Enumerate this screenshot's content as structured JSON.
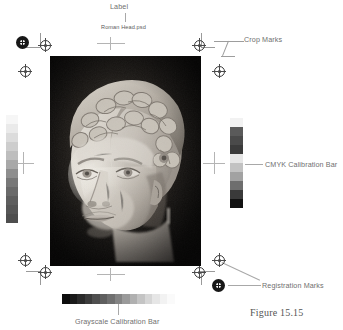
{
  "figure": {
    "caption": "Figure 15.15",
    "document_name": "Roman Head.psd"
  },
  "annotations": [
    {
      "id": "label",
      "text": "Label",
      "leader": "vertical-down"
    },
    {
      "id": "crop-marks",
      "text": "Crop Marks",
      "leader": "angled-left"
    },
    {
      "id": "cmyk-bar",
      "text": "CMYK Calibration Bar",
      "leader": "horizontal-left"
    },
    {
      "id": "registration",
      "text": "Registration Marks",
      "leader": "two-diagonals-left"
    },
    {
      "id": "grayscale-bar",
      "text": "Grayscale Calibration Bar",
      "leader": "vertical-up"
    }
  ],
  "page_label": {
    "text": "Roman Head.psd"
  },
  "colors": {
    "page_background": "#ffffff",
    "annotation_text": "#6f6f6f",
    "leader_line": "#a8a8a8",
    "registration_mark": "#1c1c1c",
    "crop_mark": "#9a9a9a",
    "caption_text": "#555555",
    "photo_background": "#14110f"
  },
  "calibration": {
    "grayscale_vertical": {
      "orientation": "vertical",
      "from": "white",
      "to": "dark-gray",
      "swatches": [
        "#f6f6f6",
        "#eaeaea",
        "#dcdcdc",
        "#cdcdcd",
        "#bdbdbd",
        "#a8a8a8",
        "#8e8e8e",
        "#787878",
        "#6a6a6a",
        "#5e5e5e",
        "#565656",
        "#4e4e4e"
      ]
    },
    "cmyk_vertical": {
      "orientation": "vertical",
      "swatches": [
        "#f2f2f2",
        "#5a5a5a",
        "#4a4a4a",
        "#3b3b3b",
        "#e6e6e6",
        "#c2c2c2",
        "#a2a2a2",
        "#6e6e6e",
        "#3a3a3a",
        "#121212"
      ]
    },
    "grayscale_horizontal": {
      "orientation": "horizontal",
      "from": "black",
      "to": "white",
      "swatches": [
        "#0d0d0d",
        "#1a1a1a",
        "#2b2b2b",
        "#3c3c3c",
        "#4f4f4f",
        "#5f5f5f",
        "#707070",
        "#848484",
        "#9a9a9a",
        "#b0b0b0",
        "#c4c4c4",
        "#d6d6d6",
        "#e6e6e6",
        "#f2f2f2",
        "#fafafa"
      ]
    }
  },
  "marks": {
    "registration_target_name": "registration-target-mark",
    "registration_solid_name": "registration-solid-mark",
    "crop_mark_name": "crop-mark",
    "center_mark_name": "center-registration-crosshair"
  }
}
